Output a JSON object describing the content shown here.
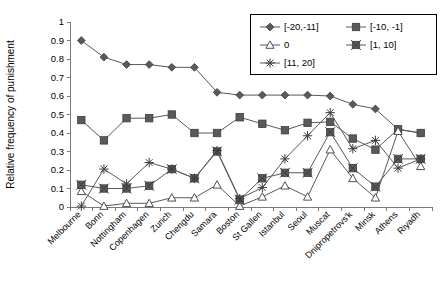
{
  "chart_data": {
    "type": "line",
    "title": "",
    "xlabel": "",
    "ylabel": "Relative frequency of punishment",
    "ylim": [
      0,
      1
    ],
    "ytick_labels": [
      "0",
      "0.1",
      "0.2",
      "0.3",
      "0.4",
      "0.5",
      "0.6",
      "0.7",
      "0.8",
      "0.9",
      "1"
    ],
    "ytick_values": [
      0,
      0.1,
      0.2,
      0.3,
      0.4,
      0.5,
      0.6,
      0.7,
      0.8,
      0.9,
      1
    ],
    "grid": false,
    "legend_position": "top-right",
    "categories": [
      "Melbourne",
      "Bonn",
      "Nottingham",
      "Copenhagen",
      "Zurich",
      "Chengdu",
      "Samara",
      "Boston",
      "St Gallen",
      "Istanbul",
      "Seoul",
      "Muscat",
      "Dnipropetrovs'k",
      "Minsk",
      "Athens",
      "Riyadh"
    ],
    "series": [
      {
        "name": "[-20,-11]",
        "marker": "diamond",
        "values": [
          0.9,
          0.81,
          0.77,
          0.77,
          0.755,
          0.755,
          0.62,
          0.605,
          0.605,
          0.605,
          0.605,
          0.6,
          0.555,
          0.53,
          0.42,
          0.4
        ]
      },
      {
        "name": "[-10, -1]",
        "marker": "square",
        "values": [
          0.47,
          0.36,
          0.48,
          0.48,
          0.5,
          0.4,
          0.4,
          0.485,
          0.45,
          0.415,
          0.455,
          0.46,
          0.37,
          0.31,
          0.42,
          0.4
        ]
      },
      {
        "name": "0",
        "marker": "triangle",
        "values": [
          0.085,
          0.005,
          0.02,
          0.02,
          0.05,
          0.05,
          0.12,
          0.005,
          0.055,
          0.115,
          0.055,
          0.31,
          0.155,
          0.05,
          0.41,
          0.22
        ]
      },
      {
        "name": "[1, 10]",
        "marker": "square-x",
        "values": [
          0.12,
          0.1,
          0.1,
          0.115,
          0.205,
          0.155,
          0.3,
          0.04,
          0.155,
          0.185,
          0.185,
          0.405,
          0.21,
          0.11,
          0.26,
          0.26
        ]
      },
      {
        "name": "[11, 20]",
        "marker": "star",
        "values": [
          0.005,
          0.205,
          0.125,
          0.24,
          0.205,
          0.155,
          0.305,
          0.045,
          0.105,
          0.26,
          0.385,
          0.51,
          0.315,
          0.36,
          0.21,
          0.26
        ]
      }
    ],
    "colors": {
      "line": "#595959",
      "marker_fill": "#5a5a5a",
      "marker_stroke": "#3d3d3d",
      "axis": "#7a7a7a",
      "text": "#000000",
      "background": "#ffffff"
    }
  }
}
